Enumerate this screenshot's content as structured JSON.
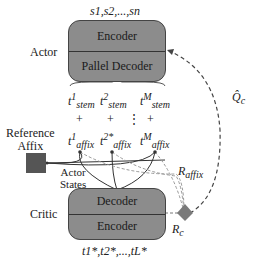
{
  "actor": {
    "label": "Actor",
    "input_seq": "s1,s2,...,sn",
    "encoder": "Encoder",
    "decoder": "Pallel Decoder"
  },
  "stems": [
    {
      "base": "t",
      "sup": "1",
      "sub": "stem"
    },
    {
      "base": "t",
      "sup": "2",
      "sub": "stem"
    },
    {
      "base": "t",
      "sup": "M",
      "sub": "stem"
    }
  ],
  "plus": [
    "+",
    "+",
    "+"
  ],
  "ellipsis": "⋮",
  "affixes": [
    {
      "base": "t",
      "sup": "1",
      "sub": "affix"
    },
    {
      "base": "t",
      "sup": "2*",
      "sub": "affix"
    },
    {
      "base": "t",
      "sup": "M",
      "sub": "affix"
    }
  ],
  "reference": {
    "line1": "Reference",
    "line2": "Affix"
  },
  "actor_states": {
    "line1": "Actor",
    "line2": "States"
  },
  "critic": {
    "label": "Critic",
    "decoder": "Decoder",
    "encoder": "Encoder",
    "output_seq": "t1*,t2*,...,tL*"
  },
  "rewards": {
    "r_affix": {
      "base": "R",
      "sub": "affix"
    },
    "r_c": {
      "base": "R",
      "sub": "c"
    },
    "q_c": {
      "base": "Q̂",
      "sub": "c"
    }
  },
  "colors": {
    "box": "#8c8c8c",
    "node": "#555555",
    "dashed": "#555555",
    "diamond": "#7a7a7a"
  }
}
